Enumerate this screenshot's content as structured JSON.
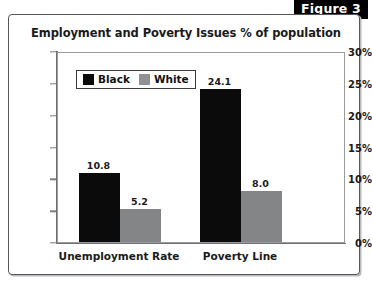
{
  "figure": {
    "badge_label": "Figure 3"
  },
  "chart_data": {
    "type": "bar",
    "title": "Employment and Poverty Issues % of population",
    "xlabel": "",
    "ylabel": "",
    "categories": [
      "Unemployment Rate",
      "Poverty Line"
    ],
    "series": [
      {
        "name": "Black",
        "color": "#0b0b0b",
        "values": [
          10.8,
          24.1
        ],
        "labels": [
          "10.8",
          "24.1"
        ]
      },
      {
        "name": "White",
        "color": "#848587",
        "values": [
          5.2,
          8.0
        ],
        "labels": [
          "5.2",
          "8.0"
        ]
      }
    ],
    "ylim": [
      0,
      30
    ],
    "ytick_values": [
      0,
      5,
      10,
      15,
      20,
      25,
      30
    ],
    "ytick_labels": [
      "0%",
      "5%",
      "10%",
      "15%",
      "20%",
      "25%",
      "30%"
    ],
    "grid": false,
    "legend_position": "upper-left-inside",
    "legend_entries": [
      "Black",
      "White"
    ]
  }
}
